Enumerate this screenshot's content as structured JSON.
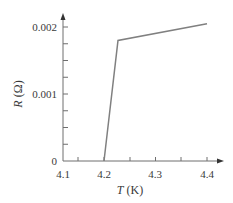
{
  "chart_data": {
    "type": "line",
    "title": "",
    "xlabel_var": "T",
    "xlabel_unit": " (K)",
    "ylabel_var": "R",
    "ylabel_unit": " (Ω)",
    "xlim": [
      4.1,
      4.4
    ],
    "ylim": [
      0,
      0.002
    ],
    "x_ticks": [
      4.1,
      4.2,
      4.3,
      4.4
    ],
    "x_tick_labels": [
      "4.1",
      "4.2",
      "4.3",
      "4.4"
    ],
    "x_minor_ticks": [
      4.15,
      4.25,
      4.35
    ],
    "y_ticks": [
      0,
      0.001,
      0.002
    ],
    "y_tick_labels": [
      "0",
      "0.001",
      "0.002"
    ],
    "y_minor_ticks": [
      0.00025,
      0.0005,
      0.00075,
      0.00125,
      0.0015,
      0.00175
    ],
    "grid": false,
    "legend": null,
    "series": [
      {
        "name": "R(T)",
        "x": [
          4.2,
          4.22,
          4.4
        ],
        "y": [
          0,
          0.0018,
          0.00205
        ]
      }
    ],
    "colors": {
      "axis": "#6e6e6e",
      "line": "#808080",
      "text": "#3a3a3a"
    }
  }
}
